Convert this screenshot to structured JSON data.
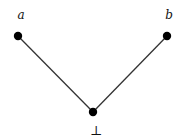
{
  "diagram": {
    "type": "hasse-diagram",
    "nodes": [
      {
        "id": "a",
        "label": "a"
      },
      {
        "id": "b",
        "label": "b"
      },
      {
        "id": "bottom",
        "label": "⊥"
      }
    ],
    "edges": [
      {
        "from": "a",
        "to": "bottom"
      },
      {
        "from": "b",
        "to": "bottom"
      }
    ]
  }
}
